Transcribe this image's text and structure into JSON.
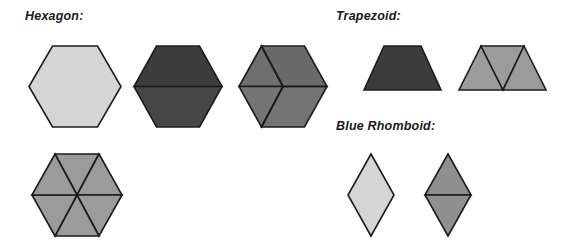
{
  "page": {
    "width": 576,
    "height": 249,
    "background": "#ffffff"
  },
  "labels": {
    "hexagon": "Hexagon:",
    "trapezoid": "Trapezoid:",
    "blue_rhomboid": "Blue Rhomboid:"
  },
  "colors": {
    "outline": "#1c1c1c",
    "light_gray": "#d5d5d5",
    "dark_gray": "#3c3c3c",
    "dark_gray_lower": "#464646",
    "medium_gray": "#6f6f6f",
    "medium_gray_2": "#757575",
    "medium_gray_3": "#6a6a6a",
    "mid_light_gray": "#9b9b9b",
    "background": "#ffffff"
  },
  "shapes": {
    "hexagon_group": {
      "label_key": "hexagon",
      "items": [
        {
          "name": "hexagon-whole",
          "fill": "#d5d5d5",
          "parts": 1,
          "division": "none",
          "x": 28,
          "y": 45,
          "width": 94,
          "height": 83
        },
        {
          "name": "hexagon-two-trapezoids",
          "fill": "#3c3c3c",
          "parts": 2,
          "division": "horizontal-split-into-two-trapezoids",
          "x": 133,
          "y": 45,
          "width": 90,
          "height": 83
        },
        {
          "name": "hexagon-three-rhombi",
          "fill": "#6f6f6f",
          "parts": 3,
          "division": "y-split-into-three-rhombi",
          "x": 238,
          "y": 45,
          "width": 90,
          "height": 83
        },
        {
          "name": "hexagon-six-triangles",
          "fill": "#9b9b9b",
          "parts": 6,
          "division": "radial-split-into-six-triangles",
          "x": 31,
          "y": 153,
          "width": 92,
          "height": 84
        }
      ]
    },
    "trapezoid_group": {
      "label_key": "trapezoid",
      "items": [
        {
          "name": "trapezoid-whole",
          "fill": "#3c3c3c",
          "parts": 1,
          "division": "none",
          "x": 363,
          "y": 45,
          "width": 79,
          "height": 45
        },
        {
          "name": "trapezoid-three-triangles",
          "fill": "#9b9b9b",
          "parts": 3,
          "division": "split-into-three-triangles",
          "x": 458,
          "y": 45,
          "width": 89,
          "height": 45
        }
      ]
    },
    "rhomboid_group": {
      "label_key": "blue_rhomboid",
      "items": [
        {
          "name": "rhomboid-whole",
          "fill": "#d5d5d5",
          "parts": 1,
          "division": "none",
          "x": 347,
          "y": 153,
          "width": 48,
          "height": 84
        },
        {
          "name": "rhomboid-two-triangles",
          "fill": "#8f8f8f",
          "parts": 2,
          "division": "horizontal-split-into-two-triangles",
          "x": 424,
          "y": 153,
          "width": 48,
          "height": 84
        }
      ]
    }
  }
}
